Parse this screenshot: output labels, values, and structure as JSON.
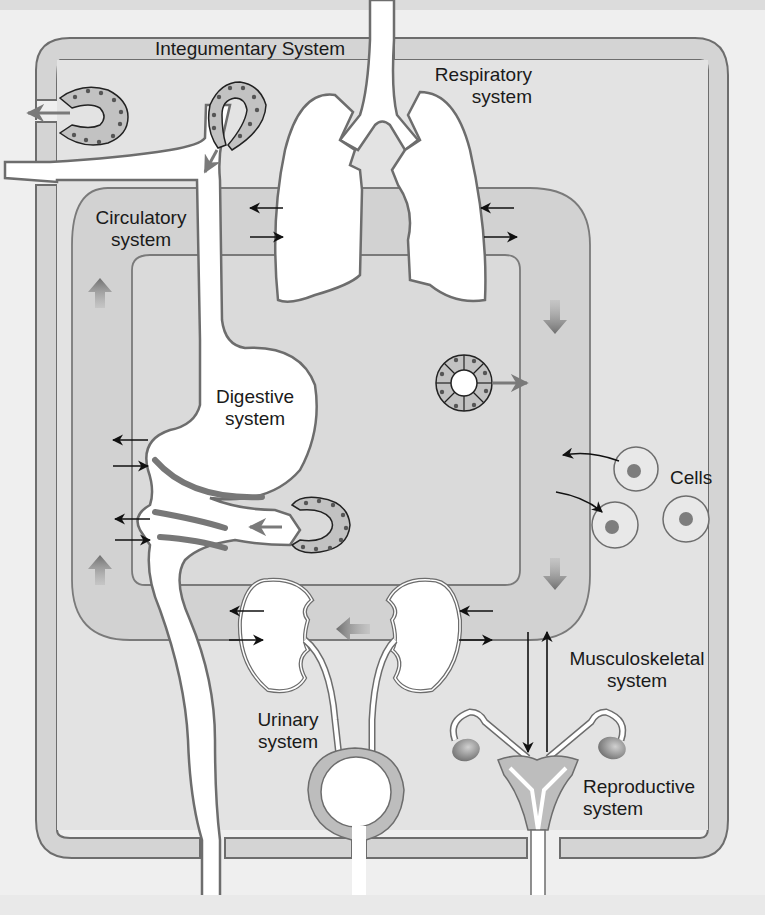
{
  "figure": {
    "type": "body-systems-interaction-diagram",
    "colors": {
      "page_background": "#efefef",
      "tissue_fill": "#d6d6d6",
      "body_fill": "#e2e2e2",
      "outline": "#6d6d6d",
      "organ_fill": "#ffffff",
      "cell_fill": "#c4c4c4",
      "nucleus": "#808080",
      "flow_arrow": "#7a7a7a",
      "exchange_arrow": "#111111"
    }
  },
  "labels": {
    "integumentary": "Integumentary System",
    "respiratory_line1": "Respiratory",
    "respiratory_line2": "system",
    "circulatory_line1": "Circulatory",
    "circulatory_line2": "system",
    "digestive_line1": "Digestive",
    "digestive_line2": "system",
    "cells": "Cells",
    "urinary_line1": "Urinary",
    "urinary_line2": "system",
    "musculoskeletal_line1": "Musculoskeletal",
    "musculoskeletal_line2": "system",
    "reproductive_line1": "Reproductive",
    "reproductive_line2": "system"
  },
  "components": {
    "systems": [
      "Integumentary",
      "Respiratory",
      "Circulatory",
      "Digestive",
      "Urinary",
      "Musculoskeletal",
      "Reproductive"
    ],
    "circulation_direction": "clockwise",
    "cells_count": 3,
    "glands": [
      "skin sweat gland",
      "skin gland to airway",
      "digestive gland",
      "endocrine gland (circular)"
    ]
  }
}
